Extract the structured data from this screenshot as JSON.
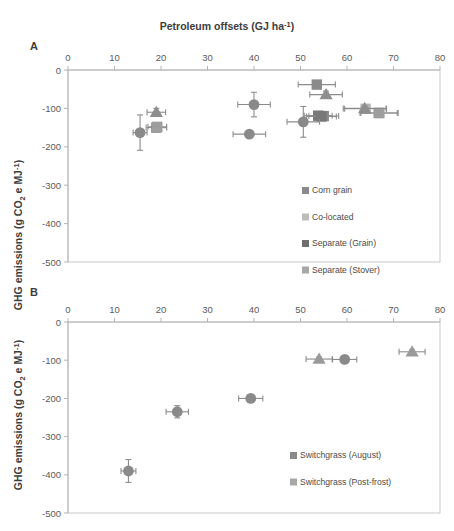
{
  "figure": {
    "top_title": "Petroleum offsets (GJ ha-1)",
    "top_title_unit_sup": "-1",
    "top_title_main": "Petroleum offsets (GJ ha",
    "top_title_tail": ")",
    "y_axis_label_part1": "GHG emissions (g CO",
    "y_axis_label_sub": "2",
    "y_axis_label_part2": " e MJ",
    "y_axis_label_sup": "-1",
    "y_axis_label_part3": ")"
  },
  "chart_data": [
    {
      "type": "scatter",
      "panel": "A",
      "title": "Petroleum offsets (GJ ha-1)",
      "xlabel": "Petroleum offsets (GJ ha-1)",
      "ylabel": "GHG emissions (g CO2 e MJ-1)",
      "xlim": [
        0,
        80
      ],
      "ylim": [
        -500,
        0
      ],
      "xticks": [
        0,
        10,
        20,
        30,
        40,
        50,
        60,
        70,
        80
      ],
      "yticks": [
        0,
        -100,
        -200,
        -300,
        -400,
        -500
      ],
      "xtick_labels": [
        "0",
        "10",
        "20",
        "30",
        "40",
        "50",
        "60",
        "70",
        "80"
      ],
      "ytick_labels": [
        "0",
        "-100",
        "-200",
        "-300",
        "-400",
        "-500"
      ],
      "grid": false,
      "legend_position": "inside-right",
      "series": [
        {
          "name": "Corn grain",
          "marker": "square",
          "color": "#8a8a8a",
          "points": [
            {
              "x": 19.0,
              "y": -150,
              "xerr": 2.2,
              "yerr": 8
            },
            {
              "x": 53.5,
              "y": -38,
              "xerr": 4.0,
              "yerr": 8
            },
            {
              "x": 55.0,
              "y": -120,
              "xerr": 3.2,
              "yerr": 6
            }
          ]
        },
        {
          "name": "Co-located",
          "marker": "square",
          "color": "#b3b3b3",
          "points": [
            {
              "x": 64.0,
              "y": -101,
              "xerr": 4.5,
              "yerr": 6
            },
            {
              "x": 67.0,
              "y": -112,
              "xerr": 4.0,
              "yerr": 6
            }
          ]
        },
        {
          "name": "Separate (Grain)",
          "marker": "square",
          "color": "#787878",
          "points": [
            {
              "x": 53.8,
              "y": -119,
              "xerr": 3.0,
              "yerr": 6
            },
            {
              "x": 54.5,
              "y": -121,
              "xerr": 3.2,
              "yerr": 6
            }
          ]
        },
        {
          "name": "Separate (Stover)",
          "marker": "square",
          "color": "#9e9e9e",
          "points": [
            {
              "x": 19.2,
              "y": -148,
              "xerr": 2.0,
              "yerr": 6
            },
            {
              "x": 66.8,
              "y": -112,
              "xerr": 4.0,
              "yerr": 6
            }
          ]
        },
        {
          "name": "circles-dark",
          "marker": "circle",
          "color": "#8a8a8a",
          "points": [
            {
              "x": 15.5,
              "y": -163,
              "xerr": 1.5,
              "yerr": 46
            },
            {
              "x": 40.0,
              "y": -90,
              "xerr": 3.5,
              "yerr": 32
            },
            {
              "x": 39.0,
              "y": -167,
              "xerr": 3.5,
              "yerr": 7
            },
            {
              "x": 50.6,
              "y": -135,
              "xerr": 3.5,
              "yerr": 40
            }
          ]
        },
        {
          "name": "triangles",
          "marker": "triangle",
          "color": "#8e8e8e",
          "points": [
            {
              "x": 19.0,
              "y": -110,
              "xerr": 2.0,
              "yerr": 10
            },
            {
              "x": 55.5,
              "y": -64,
              "xerr": 3.5,
              "yerr": 9
            },
            {
              "x": 63.8,
              "y": -100,
              "xerr": 4.6,
              "yerr": 6
            }
          ]
        }
      ],
      "legend": [
        {
          "label": "Corn grain",
          "color": "#8a8a8a"
        },
        {
          "label": "Co-located",
          "color": "#bdbdbd"
        },
        {
          "label": "Separate (Grain)",
          "color": "#6e6e6e"
        },
        {
          "label": "Separate (Stover)",
          "color": "#a8a8a8"
        }
      ]
    },
    {
      "type": "scatter",
      "panel": "B",
      "xlabel": "Petroleum offsets (GJ ha-1)",
      "ylabel": "GHG emissions (g CO2 e MJ-1)",
      "xlim": [
        0,
        80
      ],
      "ylim": [
        -500,
        0
      ],
      "xticks": [
        0,
        10,
        20,
        30,
        40,
        50,
        60,
        70,
        80
      ],
      "yticks": [
        0,
        -100,
        -200,
        -300,
        -400,
        -500
      ],
      "xtick_labels": [
        "0",
        "10",
        "20",
        "30",
        "40",
        "50",
        "60",
        "70",
        "80"
      ],
      "ytick_labels": [
        "0",
        "-100",
        "-200",
        "-300",
        "-400",
        "-500"
      ],
      "grid": false,
      "legend_position": "inside-right",
      "series": [
        {
          "name": "Switchgrass (August)",
          "marker": "circle",
          "color": "#8a8a8a",
          "points": [
            {
              "x": 13.0,
              "y": -390,
              "xerr": 1.6,
              "yerr": 30
            },
            {
              "x": 23.5,
              "y": -235,
              "xerr": 2.4,
              "yerr": 16
            },
            {
              "x": 39.3,
              "y": -200,
              "xerr": 2.6,
              "yerr": 8
            },
            {
              "x": 59.5,
              "y": -98,
              "xerr": 2.6,
              "yerr": 5
            }
          ]
        },
        {
          "name": "Switchgrass (Post-frost)",
          "marker": "triangle",
          "color": "#9a9a9a",
          "points": [
            {
              "x": 54.0,
              "y": -97,
              "xerr": 2.8,
              "yerr": 5
            },
            {
              "x": 74.0,
              "y": -78,
              "xerr": 2.8,
              "yerr": 5
            }
          ]
        }
      ],
      "legend": [
        {
          "label": "Switchgrass (August)",
          "color": "#8a8a8a"
        },
        {
          "label": "Switchgrass (Post-frost)",
          "color": "#a8a8a8"
        }
      ]
    }
  ],
  "panelA": {
    "label": "A",
    "legend": [
      {
        "label": "Corn grain"
      },
      {
        "label": "Co-located"
      },
      {
        "label": "Separate (Grain)"
      },
      {
        "label": "Separate (Stover)"
      }
    ]
  },
  "panelB": {
    "label": "B",
    "legend": [
      {
        "label": "Switchgrass (August)"
      },
      {
        "label": "Switchgrass (Post-frost)"
      }
    ]
  }
}
